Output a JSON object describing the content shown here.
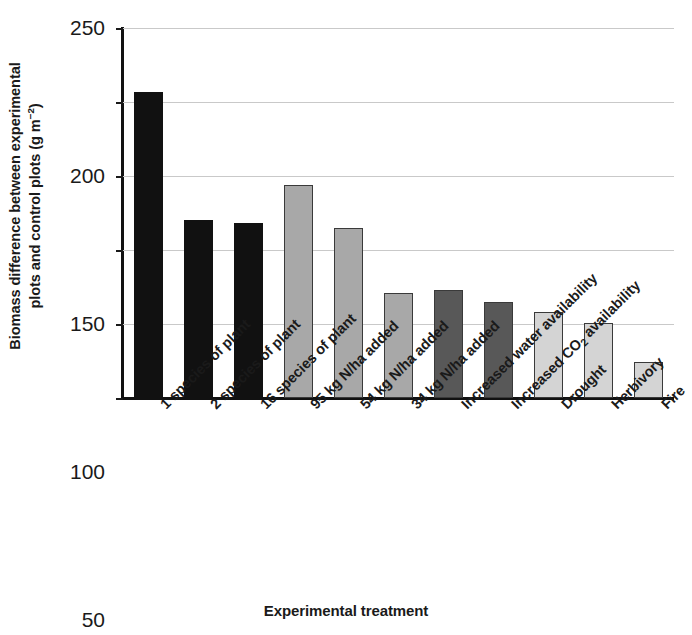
{
  "chart_data": {
    "type": "bar",
    "title": "",
    "xlabel": "Experimental treatment",
    "ylabel": "Biomass difference between experimental plots and control plots (g m⁻²)",
    "ylabel_line1": "Biomass difference between experimental",
    "ylabel_line2_pre": "plots and control plots (g m",
    "ylabel_line2_sup": "−2",
    "ylabel_line2_post": ")",
    "categories": [
      "1 species of plant",
      "2 species of plant",
      "16 species of plant",
      "95 kg N/ha added",
      "54 kg N/ha added",
      "34 kg N/ha added",
      "Increased water availability",
      "Increased CO2 availability",
      "Drought",
      "Herbivory",
      "Fire"
    ],
    "values": [
      207,
      120,
      118,
      144,
      115,
      71,
      73,
      65,
      58,
      51,
      24
    ],
    "bar_colors": [
      "#111111",
      "#111111",
      "#111111",
      "#a8a8a8",
      "#a8a8a8",
      "#a8a8a8",
      "#585858",
      "#585858",
      "#d4d4d4",
      "#d4d4d4",
      "#d4d4d4"
    ],
    "ylim": [
      0,
      250
    ],
    "yticks": [
      0,
      50,
      100,
      150,
      200,
      250
    ],
    "ytick_labels": [
      "0",
      "50",
      "100",
      "150",
      "200",
      "250"
    ],
    "grid": true,
    "grid_color": "#c9c9c9",
    "legend": "none",
    "axis_color": "#111111"
  }
}
